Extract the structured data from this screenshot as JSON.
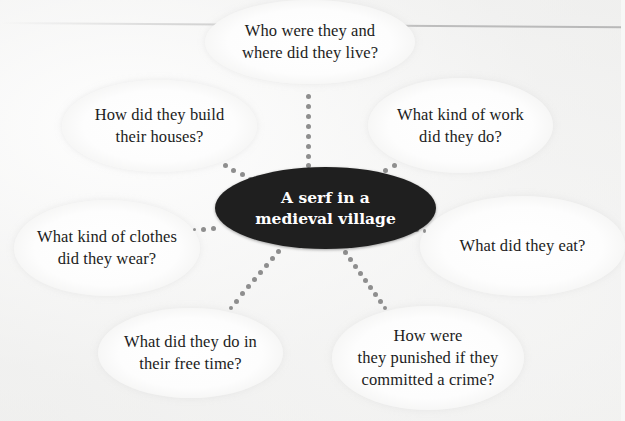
{
  "diagram": {
    "type": "mind-map",
    "center": {
      "label": "A serf in a\nmedieval village",
      "fill": "#1f1f1f",
      "text_color": "#ffffff"
    },
    "branches": [
      {
        "id": "top",
        "label": "Who were they and\nwhere did they live?"
      },
      {
        "id": "upper-left",
        "label": "How did they build\ntheir houses?"
      },
      {
        "id": "upper-right",
        "label": "What kind of work\ndid they do?"
      },
      {
        "id": "left",
        "label": "What kind of clothes\ndid they wear?"
      },
      {
        "id": "right",
        "label": "What did they eat?"
      },
      {
        "id": "lower-left",
        "label": "What did they do in\ntheir free time?"
      },
      {
        "id": "lower-right",
        "label": "How were\nthey punished if they\ncommitted a crime?"
      }
    ],
    "connector_style": "dotted",
    "connector_color": "#8e8e8e"
  }
}
